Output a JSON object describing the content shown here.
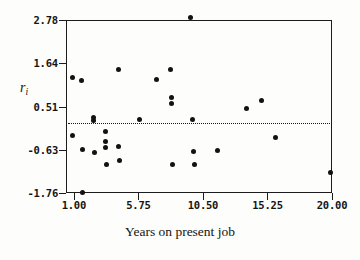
{
  "chart_data": {
    "type": "scatter",
    "title": "",
    "xlabel": "Years on present job",
    "ylabel": "r_i",
    "ylabel_base": "r",
    "ylabel_sub": "i",
    "xlim": [
      0.42,
      20.0
    ],
    "ylim": [
      -1.76,
      2.78
    ],
    "grid": false,
    "legend": false,
    "xticks": [
      "1.00",
      "5.75",
      "10.50",
      "15.25",
      "20.00"
    ],
    "xtick_values": [
      1.0,
      5.75,
      10.5,
      15.25,
      20.0
    ],
    "yticks": [
      "2.78",
      "1.64",
      "0.51",
      "-0.63",
      "-1.76"
    ],
    "ytick_values": [
      2.78,
      1.64,
      0.51,
      -0.63,
      -1.76
    ],
    "reference_line": {
      "type": "horizontal-dotted",
      "y": 0.08,
      "style": "dotted"
    },
    "points": [
      {
        "x": 0.9,
        "y": 1.28
      },
      {
        "x": 0.9,
        "y": -0.25
      },
      {
        "x": 1.55,
        "y": 1.18
      },
      {
        "x": 1.6,
        "y": -0.62
      },
      {
        "x": 1.6,
        "y": -1.74
      },
      {
        "x": 2.45,
        "y": 0.22
      },
      {
        "x": 2.45,
        "y": 0.14
      },
      {
        "x": 2.5,
        "y": -0.7
      },
      {
        "x": 3.35,
        "y": -0.14
      },
      {
        "x": 3.35,
        "y": -0.42
      },
      {
        "x": 3.35,
        "y": -0.57
      },
      {
        "x": 3.4,
        "y": -1.02
      },
      {
        "x": 4.25,
        "y": 1.48
      },
      {
        "x": 4.3,
        "y": -0.55
      },
      {
        "x": 4.35,
        "y": -0.92
      },
      {
        "x": 5.8,
        "y": 0.18
      },
      {
        "x": 7.05,
        "y": 1.22
      },
      {
        "x": 8.1,
        "y": 1.48
      },
      {
        "x": 8.15,
        "y": 0.75
      },
      {
        "x": 8.2,
        "y": 0.58
      },
      {
        "x": 8.25,
        "y": -1.02
      },
      {
        "x": 9.6,
        "y": 2.85
      },
      {
        "x": 9.75,
        "y": 0.18
      },
      {
        "x": 9.8,
        "y": -0.66
      },
      {
        "x": 9.85,
        "y": -1.02
      },
      {
        "x": 11.6,
        "y": -0.64
      },
      {
        "x": 13.7,
        "y": 0.47
      },
      {
        "x": 14.8,
        "y": 0.67
      },
      {
        "x": 15.85,
        "y": -0.3
      },
      {
        "x": 19.9,
        "y": -1.22
      }
    ]
  },
  "colors": {
    "point": "#121212",
    "axis": "#1c1c1c",
    "text": "#141414",
    "background": "#fdfdfb"
  }
}
